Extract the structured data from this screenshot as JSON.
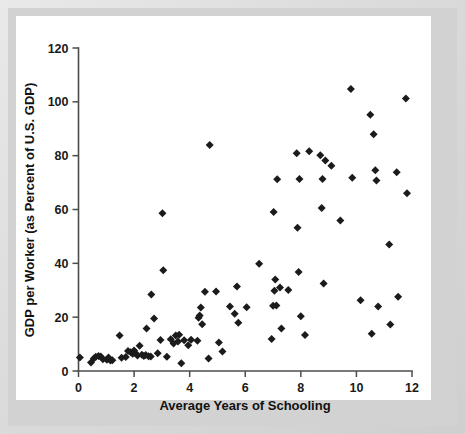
{
  "figure": {
    "frame_color": "#d9d9d9",
    "plot_background": "#ffffff",
    "marker_color": "#1b1b1b",
    "axis_color": "#4c4c4c"
  },
  "chart_data": {
    "type": "scatter",
    "title": "",
    "xlabel": "Average Years of Schooling",
    "ylabel": "GDP per Worker (as Percent of U.S. GDP)",
    "xlim": [
      0,
      12
    ],
    "ylim": [
      0,
      120
    ],
    "xticks": [
      0,
      2,
      4,
      6,
      8,
      10,
      12
    ],
    "xtick_labels": [
      "0",
      "2",
      "4",
      "6",
      "8",
      "10",
      "12"
    ],
    "yticks": [
      0,
      20,
      40,
      60,
      80,
      100,
      120
    ],
    "ytick_labels": [
      "0",
      "20",
      "40",
      "60",
      "80",
      "100",
      "120"
    ],
    "grid": false,
    "legend": false,
    "legend_position": "none",
    "marker": "diamond",
    "series": [
      {
        "name": "Countries",
        "points": [
          [
            0.05,
            5.0
          ],
          [
            0.45,
            3.2
          ],
          [
            0.55,
            4.6
          ],
          [
            0.62,
            5.3
          ],
          [
            0.72,
            5.6
          ],
          [
            0.8,
            5.4
          ],
          [
            0.88,
            4.4
          ],
          [
            1.02,
            4.2
          ],
          [
            1.08,
            5.0
          ],
          [
            1.15,
            3.9
          ],
          [
            1.22,
            4.0
          ],
          [
            1.48,
            13.2
          ],
          [
            1.55,
            4.9
          ],
          [
            1.7,
            5.2
          ],
          [
            1.78,
            7.4
          ],
          [
            1.88,
            7.0
          ],
          [
            1.95,
            6.4
          ],
          [
            2.0,
            7.6
          ],
          [
            2.05,
            6.6
          ],
          [
            2.12,
            5.8
          ],
          [
            2.2,
            9.4
          ],
          [
            2.28,
            6.0
          ],
          [
            2.35,
            5.6
          ],
          [
            2.42,
            5.9
          ],
          [
            2.45,
            15.8
          ],
          [
            2.52,
            5.5
          ],
          [
            2.6,
            5.4
          ],
          [
            2.62,
            28.4
          ],
          [
            2.72,
            19.5
          ],
          [
            2.85,
            6.6
          ],
          [
            2.95,
            11.5
          ],
          [
            3.02,
            58.6
          ],
          [
            3.05,
            37.4
          ],
          [
            3.18,
            5.3
          ],
          [
            3.32,
            11.8
          ],
          [
            3.42,
            10.2
          ],
          [
            3.5,
            13.2
          ],
          [
            3.58,
            11.0
          ],
          [
            3.62,
            13.5
          ],
          [
            3.7,
            2.9
          ],
          [
            3.8,
            11.4
          ],
          [
            3.95,
            9.6
          ],
          [
            4.05,
            11.6
          ],
          [
            4.28,
            11.2
          ],
          [
            4.32,
            19.8
          ],
          [
            4.36,
            20.6
          ],
          [
            4.4,
            23.6
          ],
          [
            4.45,
            17.4
          ],
          [
            4.55,
            29.4
          ],
          [
            4.68,
            4.6
          ],
          [
            4.72,
            84.0
          ],
          [
            4.95,
            29.5
          ],
          [
            5.05,
            10.6
          ],
          [
            5.18,
            7.2
          ],
          [
            5.45,
            24.0
          ],
          [
            5.62,
            21.3
          ],
          [
            5.7,
            31.4
          ],
          [
            5.75,
            17.9
          ],
          [
            6.05,
            23.7
          ],
          [
            6.5,
            39.8
          ],
          [
            6.95,
            11.9
          ],
          [
            7.0,
            24.2
          ],
          [
            7.02,
            59.1
          ],
          [
            7.05,
            29.8
          ],
          [
            7.08,
            34.0
          ],
          [
            7.12,
            24.3
          ],
          [
            7.15,
            71.2
          ],
          [
            7.25,
            31.0
          ],
          [
            7.3,
            15.8
          ],
          [
            7.55,
            30.1
          ],
          [
            7.85,
            80.9
          ],
          [
            7.88,
            53.2
          ],
          [
            7.92,
            36.8
          ],
          [
            7.95,
            71.3
          ],
          [
            8.0,
            20.3
          ],
          [
            8.15,
            13.4
          ],
          [
            8.3,
            81.6
          ],
          [
            8.7,
            80.2
          ],
          [
            8.75,
            60.6
          ],
          [
            8.78,
            71.3
          ],
          [
            8.82,
            32.5
          ],
          [
            8.88,
            78.2
          ],
          [
            9.1,
            76.3
          ],
          [
            9.42,
            55.9
          ],
          [
            9.8,
            104.8
          ],
          [
            9.85,
            71.8
          ],
          [
            10.15,
            26.3
          ],
          [
            10.5,
            95.2
          ],
          [
            10.55,
            13.8
          ],
          [
            10.62,
            88.0
          ],
          [
            10.68,
            74.6
          ],
          [
            10.72,
            70.8
          ],
          [
            10.78,
            24.0
          ],
          [
            11.18,
            47.0
          ],
          [
            11.22,
            17.3
          ],
          [
            11.45,
            73.8
          ],
          [
            11.5,
            27.6
          ],
          [
            11.78,
            101.2
          ],
          [
            11.82,
            66.0
          ]
        ]
      }
    ]
  }
}
